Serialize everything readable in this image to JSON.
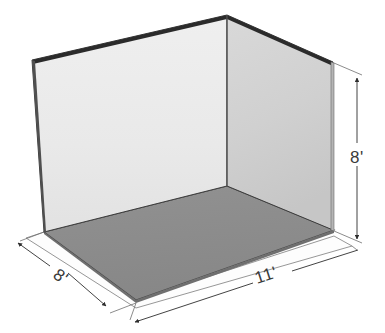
{
  "diagram": {
    "type": "3d-room-perspective",
    "background_color": "#ffffff",
    "shapes": {
      "back_wall": {
        "name": "back-wall",
        "fill_top": "#ededed",
        "fill_bottom": "#e3e3e3",
        "stroke": "#2e2e2e"
      },
      "right_wall": {
        "name": "right-wall",
        "fill_top": "#d6d6d6",
        "fill_bottom": "#c9c9c9",
        "stroke": "#2e2e2e"
      },
      "floor": {
        "name": "floor",
        "fill": "#8c8c8c",
        "stroke": "#3a3a3a"
      },
      "base_ledge": {
        "name": "base-ledge",
        "fill": "#fdfdfd",
        "stroke": "#6b6b6b"
      }
    },
    "dimensions": [
      {
        "id": "depth",
        "label": "8'",
        "position": "bottom-left",
        "orientation": "diagonal-down-right",
        "measures": "room-depth"
      },
      {
        "id": "width",
        "label": "11'",
        "position": "bottom-right",
        "orientation": "diagonal-up-right",
        "measures": "room-width"
      },
      {
        "id": "height",
        "label": "8'",
        "position": "right",
        "orientation": "vertical",
        "measures": "wall-height"
      }
    ],
    "line_color": "#2e2e2e",
    "dim_line_color": "#5a5a5a",
    "text_color": "#3a3a3a"
  }
}
